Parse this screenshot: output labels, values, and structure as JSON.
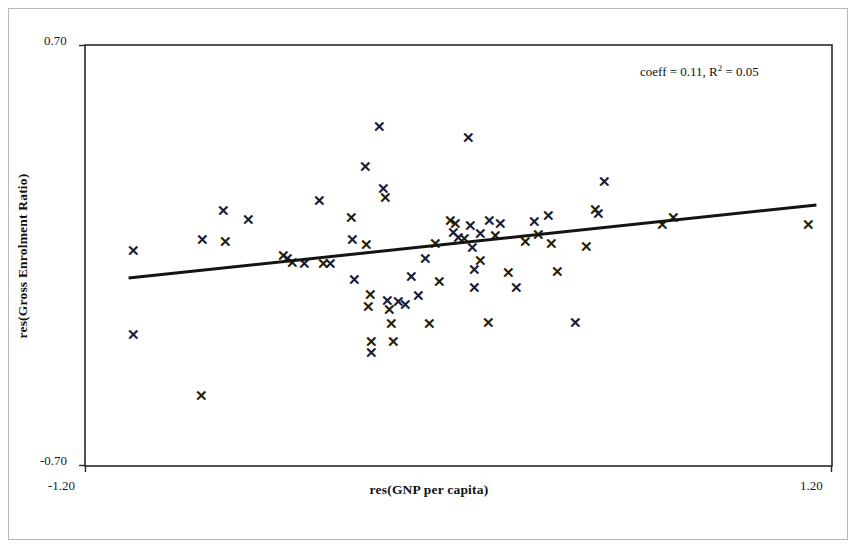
{
  "figure": {
    "annotation_prefix": "coeff = 0.11, R",
    "annotation_exponent": "2",
    "annotation_suffix": " = 0.05",
    "marker_glyph": "✕"
  },
  "chart_data": {
    "type": "scatter",
    "title": "",
    "xlabel": "res(GNP per capita)",
    "ylabel": "res(Gross Enrolment Ratio)",
    "xlim": [
      -1.2,
      1.2
    ],
    "ylim": [
      -0.7,
      0.7
    ],
    "xticklabels": [
      "-1.20",
      "1.20"
    ],
    "yticklabels": [
      "-0.70",
      "0.70"
    ],
    "grid": false,
    "legend": null,
    "annotations": [
      {
        "text": "coeff = 0.11, R2 = 0.05",
        "coeff": 0.11,
        "r_squared": 0.05
      }
    ],
    "trendline": {
      "type": "linear",
      "slope": 0.11,
      "x_start": -1.06,
      "y_start": -0.075,
      "x_end": 1.15,
      "y_end": 0.168
    },
    "points": [
      {
        "x": -1.043,
        "y": 0.018
      },
      {
        "x": -1.043,
        "y": -0.262
      },
      {
        "x": -0.827,
        "y": -0.465
      },
      {
        "x": -0.824,
        "y": 0.053
      },
      {
        "x": -0.755,
        "y": 0.151
      },
      {
        "x": -0.749,
        "y": 0.046
      },
      {
        "x": -0.675,
        "y": 0.12
      },
      {
        "x": -0.563,
        "y": 0.0
      },
      {
        "x": -0.549,
        "y": -0.009
      },
      {
        "x": -0.534,
        "y": -0.022
      },
      {
        "x": -0.495,
        "y": -0.026
      },
      {
        "x": -0.446,
        "y": 0.182
      },
      {
        "x": -0.435,
        "y": -0.026
      },
      {
        "x": -0.41,
        "y": -0.026
      },
      {
        "x": -0.345,
        "y": 0.127
      },
      {
        "x": -0.34,
        "y": 0.053
      },
      {
        "x": -0.334,
        "y": -0.079
      },
      {
        "x": -0.3,
        "y": 0.295
      },
      {
        "x": -0.295,
        "y": 0.036
      },
      {
        "x": -0.289,
        "y": -0.17
      },
      {
        "x": -0.283,
        "y": -0.129
      },
      {
        "x": -0.28,
        "y": -0.285
      },
      {
        "x": -0.278,
        "y": -0.322
      },
      {
        "x": -0.255,
        "y": 0.428
      },
      {
        "x": -0.241,
        "y": 0.223
      },
      {
        "x": -0.236,
        "y": 0.193
      },
      {
        "x": -0.227,
        "y": -0.149
      },
      {
        "x": -0.221,
        "y": -0.179
      },
      {
        "x": -0.215,
        "y": -0.225
      },
      {
        "x": -0.21,
        "y": -0.285
      },
      {
        "x": -0.193,
        "y": -0.152
      },
      {
        "x": -0.17,
        "y": -0.164
      },
      {
        "x": -0.15,
        "y": -0.07
      },
      {
        "x": -0.13,
        "y": -0.132
      },
      {
        "x": -0.105,
        "y": -0.009
      },
      {
        "x": -0.092,
        "y": -0.225
      },
      {
        "x": -0.075,
        "y": 0.04
      },
      {
        "x": -0.06,
        "y": -0.086
      },
      {
        "x": -0.025,
        "y": 0.118
      },
      {
        "x": -0.015,
        "y": 0.075
      },
      {
        "x": -0.01,
        "y": 0.108
      },
      {
        "x": 0.0,
        "y": 0.061
      },
      {
        "x": 0.02,
        "y": 0.056
      },
      {
        "x": 0.033,
        "y": 0.392
      },
      {
        "x": 0.04,
        "y": 0.1
      },
      {
        "x": 0.045,
        "y": 0.026
      },
      {
        "x": 0.05,
        "y": -0.045
      },
      {
        "x": 0.052,
        "y": -0.107
      },
      {
        "x": 0.07,
        "y": 0.073
      },
      {
        "x": 0.072,
        "y": -0.015
      },
      {
        "x": 0.095,
        "y": -0.222
      },
      {
        "x": 0.1,
        "y": 0.116
      },
      {
        "x": 0.118,
        "y": 0.066
      },
      {
        "x": 0.135,
        "y": 0.106
      },
      {
        "x": 0.16,
        "y": -0.056
      },
      {
        "x": 0.185,
        "y": -0.108
      },
      {
        "x": 0.215,
        "y": 0.048
      },
      {
        "x": 0.245,
        "y": 0.114
      },
      {
        "x": 0.258,
        "y": 0.071
      },
      {
        "x": 0.29,
        "y": 0.132
      },
      {
        "x": 0.3,
        "y": 0.04
      },
      {
        "x": 0.318,
        "y": -0.052
      },
      {
        "x": 0.375,
        "y": -0.222
      },
      {
        "x": 0.41,
        "y": 0.03
      },
      {
        "x": 0.44,
        "y": 0.152
      },
      {
        "x": 0.45,
        "y": 0.14
      },
      {
        "x": 0.47,
        "y": 0.245
      },
      {
        "x": 0.655,
        "y": 0.103
      },
      {
        "x": 0.69,
        "y": 0.126
      },
      {
        "x": 1.125,
        "y": 0.104
      }
    ]
  }
}
